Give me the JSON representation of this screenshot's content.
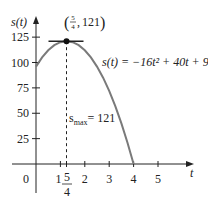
{
  "chart_data": {
    "type": "line",
    "title": "",
    "xlabel": "t",
    "ylabel": "s(t)",
    "function": "s(t) = -16t^2 + 40t + 96",
    "equation_label": "s(t) = −16t² + 40t + 96",
    "x_ticks": [
      1,
      2,
      3,
      4,
      5
    ],
    "x_tick_labels": [
      "1",
      "2",
      "3",
      "4",
      "5"
    ],
    "y_ticks": [
      25,
      50,
      75,
      100,
      125
    ],
    "y_tick_labels": [
      "25",
      "50",
      "75",
      "100",
      "125"
    ],
    "origin_label": "0",
    "xlim": [
      0,
      5.5
    ],
    "ylim": [
      0,
      130
    ],
    "grid": false,
    "series": [
      {
        "name": "s(t)",
        "x": [
          0,
          0.25,
          0.5,
          0.75,
          1,
          1.25,
          1.5,
          1.75,
          2,
          2.25,
          2.5,
          2.75,
          3,
          3.25,
          3.5,
          3.75,
          4
        ],
        "values": [
          96,
          105,
          112,
          117,
          120,
          121,
          120,
          117,
          112,
          105,
          96,
          85,
          72,
          57,
          40,
          21,
          0
        ]
      }
    ],
    "annotations": {
      "max_point": {
        "x": 1.25,
        "y": 121,
        "label_num": "5",
        "label_den": "4",
        "label_value": "121"
      },
      "max_label_prefix": "s",
      "max_label_sub": "max",
      "max_label_suffix": "= 121",
      "special_tick": {
        "x": 1.25,
        "num": "5",
        "den": "4"
      },
      "tangent_line_at_max": true,
      "dashed_line_from_max_to_axis": true
    },
    "colors": {
      "curve": "#7a7a7a",
      "axis": "#222222",
      "point": "#111111"
    }
  }
}
